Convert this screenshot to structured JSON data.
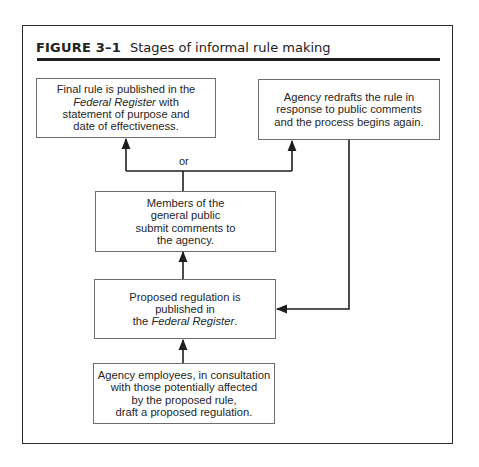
{
  "figure": {
    "label": "FIGURE 3–1",
    "caption": "Stages of informal rule making"
  },
  "boxes": {
    "final_rule": {
      "line1": "Final rule is published in the",
      "line2_italic": "Federal Register",
      "line2_rest": " with",
      "line3": "statement of purpose and",
      "line4": "date of effectiveness."
    },
    "redraft": {
      "line1": "Agency redrafts the rule in",
      "line2": "response to public comments",
      "line3": "and the process begins again."
    },
    "public_comments": {
      "line1": "Members of the",
      "line2": "general public",
      "line3": "submit comments to",
      "line4": "the agency."
    },
    "proposed_published": {
      "line1": "Proposed regulation is",
      "line2": "published in",
      "line3_pre": "the ",
      "line3_italic": "Federal Register",
      "line3_post": "."
    },
    "draft": {
      "line1": "Agency employees, in consultation",
      "line2": "with those potentially affected",
      "line3": "by the proposed rule,",
      "line4": "draft a proposed regulation."
    }
  },
  "branch_label": "or",
  "colors": {
    "frame": "#2b2b2b",
    "box_border": "#6d6d6d",
    "arrow": "#1e1e1e",
    "text": "#262626"
  }
}
